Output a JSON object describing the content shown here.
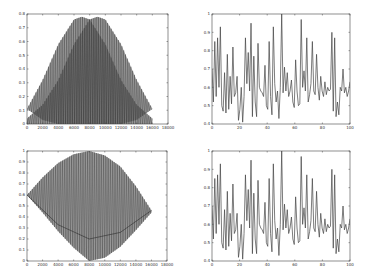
{
  "chart_data": [
    {
      "id": "top-left",
      "type": "area",
      "title": "",
      "xlabel": "",
      "ylabel": "",
      "xlim": [
        0,
        18000
      ],
      "ylim": [
        0,
        0.8
      ],
      "xticks": [
        0,
        2000,
        4000,
        6000,
        8000,
        10000,
        12000,
        14000,
        16000,
        18000
      ],
      "yticks": [
        0,
        0.1,
        0.2,
        0.3,
        0.4,
        0.5,
        0.6,
        0.7,
        0.8
      ],
      "grid": false,
      "series": [
        {
          "name": "envelope-1",
          "x": [
            0,
            2000,
            4000,
            6000,
            7000,
            8000,
            10000,
            12000,
            14000,
            16000
          ],
          "upper": [
            0.11,
            0.32,
            0.58,
            0.76,
            0.78,
            0.76,
            0.58,
            0.32,
            0.14,
            0.04
          ],
          "lower": [
            0.11,
            0.03,
            0.0,
            0.0,
            0.0,
            0.0,
            0.0,
            0.0,
            0.0,
            0.0
          ]
        },
        {
          "name": "envelope-2",
          "x": [
            0,
            2000,
            4000,
            6000,
            8000,
            9000,
            10000,
            12000,
            14000,
            16000
          ],
          "upper": [
            0.04,
            0.14,
            0.32,
            0.58,
            0.76,
            0.78,
            0.76,
            0.58,
            0.32,
            0.11
          ],
          "lower": [
            0.0,
            0.0,
            0.0,
            0.0,
            0.0,
            0.0,
            0.0,
            0.0,
            0.03,
            0.11
          ]
        }
      ],
      "annotation": "dense oscillation filling two overlapping bell-shaped envelopes peaking ~0.78 at x≈7000 and x≈10000; overlap triangle peaks ~0.67 at x≈8500"
    },
    {
      "id": "top-right",
      "type": "line",
      "xlim": [
        0,
        100
      ],
      "ylim": [
        0.4,
        1.0
      ],
      "xticks": [
        0,
        20,
        40,
        60,
        80,
        100
      ],
      "yticks": [
        0.4,
        0.5,
        0.6,
        0.7,
        0.8,
        0.9,
        1.0
      ],
      "grid": false,
      "series": [
        {
          "name": "signal",
          "values": [
            0.7,
            0.52,
            0.85,
            0.55,
            0.87,
            0.6,
            0.93,
            0.5,
            0.47,
            0.68,
            0.46,
            0.78,
            0.48,
            0.66,
            0.51,
            0.82,
            0.55,
            0.57,
            0.66,
            0.42,
            0.48,
            0.6,
            0.41,
            0.55,
            0.87,
            0.62,
            0.79,
            0.58,
            0.95,
            0.44,
            0.77,
            0.52,
            0.44,
            0.84,
            0.6,
            0.58,
            0.57,
            0.55,
            0.72,
            0.5,
            0.48,
            0.85,
            0.55,
            0.45,
            0.93,
            0.62,
            0.52,
            0.58,
            0.43,
            0.6,
            1.0,
            0.57,
            0.71,
            0.58,
            0.68,
            0.55,
            0.58,
            0.64,
            0.52,
            0.49,
            0.75,
            0.58,
            0.5,
            0.51,
            0.97,
            0.6,
            0.69,
            0.58,
            0.87,
            0.52,
            0.56,
            0.62,
            0.85,
            0.58,
            0.56,
            0.78,
            0.6,
            0.53,
            0.66,
            0.58,
            0.55,
            0.63,
            0.56,
            0.6,
            0.58,
            0.59,
            0.9,
            0.47,
            0.87,
            0.44,
            0.52,
            0.45,
            0.6,
            0.58,
            0.7,
            0.57,
            0.6,
            0.55,
            0.58,
            0.63
          ]
        }
      ]
    },
    {
      "id": "bottom-left",
      "type": "area",
      "xlim": [
        0,
        18000
      ],
      "ylim": [
        0,
        1.0
      ],
      "xticks": [
        0,
        2000,
        4000,
        6000,
        8000,
        10000,
        12000,
        14000,
        16000,
        18000
      ],
      "yticks": [
        0,
        0.1,
        0.2,
        0.3,
        0.4,
        0.5,
        0.6,
        0.7,
        0.8,
        0.9,
        1.0
      ],
      "grid": false,
      "series": [
        {
          "name": "envelope",
          "x": [
            0,
            2000,
            4000,
            6000,
            8000,
            10000,
            12000,
            14000,
            16000
          ],
          "upper": [
            0.6,
            0.76,
            0.89,
            0.97,
            1.0,
            0.96,
            0.86,
            0.68,
            0.46
          ],
          "lower": [
            0.6,
            0.44,
            0.27,
            0.12,
            0.0,
            0.03,
            0.13,
            0.28,
            0.44
          ]
        },
        {
          "name": "inner-curve",
          "x": [
            0,
            4000,
            8000,
            12000,
            16000
          ],
          "values": [
            0.6,
            0.33,
            0.2,
            0.26,
            0.46
          ]
        }
      ],
      "annotation": "dense oscillation within lens-shaped envelope from (0,0.6) to (16000,0.46), top ~1.0 and bottom ~0 near x≈8000"
    },
    {
      "id": "bottom-right",
      "type": "line",
      "xlim": [
        0,
        100
      ],
      "ylim": [
        0.4,
        1.0
      ],
      "xticks": [
        0,
        20,
        40,
        60,
        80,
        100
      ],
      "yticks": [
        0.4,
        0.5,
        0.6,
        0.7,
        0.8,
        0.9,
        1.0
      ],
      "grid": false,
      "series": [
        {
          "name": "signal",
          "values": [
            0.7,
            0.52,
            0.85,
            0.55,
            0.87,
            0.6,
            0.93,
            0.5,
            0.47,
            0.68,
            0.46,
            0.78,
            0.48,
            0.66,
            0.51,
            0.82,
            0.55,
            0.57,
            0.66,
            0.42,
            0.48,
            0.6,
            0.41,
            0.55,
            0.87,
            0.62,
            0.79,
            0.58,
            0.95,
            0.44,
            0.77,
            0.52,
            0.44,
            0.84,
            0.6,
            0.58,
            0.57,
            0.55,
            0.72,
            0.5,
            0.48,
            0.85,
            0.55,
            0.45,
            0.93,
            0.62,
            0.52,
            0.58,
            0.43,
            0.6,
            1.0,
            0.57,
            0.71,
            0.58,
            0.68,
            0.55,
            0.58,
            0.64,
            0.52,
            0.49,
            0.75,
            0.58,
            0.5,
            0.51,
            0.97,
            0.6,
            0.69,
            0.58,
            0.87,
            0.52,
            0.56,
            0.62,
            0.85,
            0.58,
            0.56,
            0.78,
            0.6,
            0.53,
            0.66,
            0.58,
            0.55,
            0.63,
            0.56,
            0.6,
            0.58,
            0.59,
            0.9,
            0.47,
            0.87,
            0.44,
            0.52,
            0.45,
            0.6,
            0.58,
            0.7,
            0.57,
            0.6,
            0.55,
            0.58,
            0.63
          ]
        }
      ]
    }
  ],
  "layout": {
    "frames": [
      {
        "x0": 27,
        "y0": 14,
        "x1": 168,
        "y1": 124
      },
      {
        "x0": 212,
        "y0": 14,
        "x1": 350,
        "y1": 124
      },
      {
        "x0": 27,
        "y0": 151,
        "x1": 167,
        "y1": 261
      },
      {
        "x0": 212,
        "y0": 151,
        "x1": 350,
        "y1": 261
      }
    ]
  }
}
